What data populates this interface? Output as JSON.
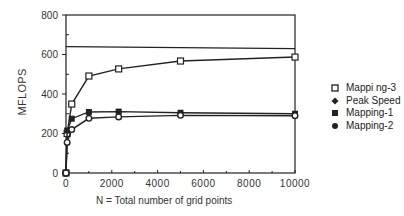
{
  "chart_data": {
    "type": "line",
    "title": "",
    "xlabel": "N = Total number of grid points",
    "ylabel": "MFLOPS",
    "xlim": [
      0,
      10000
    ],
    "ylim": [
      0,
      800
    ],
    "xticks": [
      0,
      2000,
      4000,
      6000,
      8000,
      10000
    ],
    "yticks": [
      0,
      200,
      400,
      600,
      800
    ],
    "grid": false,
    "legend_position": "right",
    "series": [
      {
        "name": "Mappi ng-3",
        "marker": "open-square",
        "x": [
          0,
          50,
          250,
          1000,
          2300,
          5000,
          10000
        ],
        "y": [
          0,
          200,
          349,
          491,
          527,
          567,
          587
        ]
      },
      {
        "name": "Peak Speed",
        "marker": "diamond",
        "x": [
          0,
          10000
        ],
        "y": [
          640,
          630
        ]
      },
      {
        "name": "Mapping-1",
        "marker": "filled-square",
        "x": [
          0,
          50,
          250,
          1000,
          2300,
          5000,
          10000
        ],
        "y": [
          0,
          215,
          275,
          309,
          311,
          305,
          300
        ]
      },
      {
        "name": "Mapping-2",
        "marker": "filled-circle",
        "x": [
          0,
          50,
          250,
          1000,
          2300,
          5000,
          10000
        ],
        "y": [
          0,
          155,
          220,
          277,
          284,
          292,
          290
        ]
      }
    ]
  },
  "legend": {
    "items": [
      "Mappi ng-3",
      "Peak Speed",
      "Mapping-1",
      "Mapping-2"
    ]
  },
  "axes": {
    "xlabel": "N = Total number of grid points",
    "ylabel": "MFLOPS"
  }
}
